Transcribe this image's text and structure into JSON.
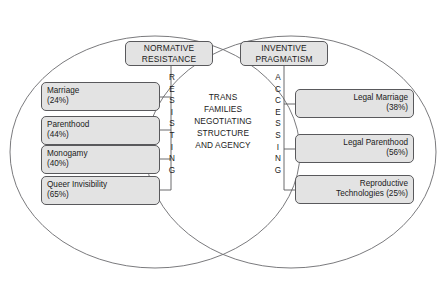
{
  "diagram": {
    "title_center": {
      "lines": [
        "TRANS",
        "FAMILIES",
        "NEGOTIATING",
        "STRUCTURE",
        "AND AGENCY"
      ]
    },
    "left_cluster": {
      "header_line1": "NORMATIVE",
      "header_line2": "RESISTANCE",
      "vertical_label": "RESISTING",
      "vertical_letters": [
        "R",
        "E",
        "S",
        "I",
        "S",
        "T",
        "I",
        "N",
        "G"
      ],
      "items": [
        {
          "label": "Marriage",
          "value": "(24%)"
        },
        {
          "label": "Parenthood",
          "value": "(44%)"
        },
        {
          "label": "Monogamy",
          "value": "(40%)"
        },
        {
          "label": "Queer Invisibility",
          "value": "(65%)"
        }
      ]
    },
    "right_cluster": {
      "header_line1": "INVENTIVE",
      "header_line2": "PRAGMATISM",
      "vertical_label": "ACCESSING",
      "vertical_letters": [
        "A",
        "C",
        "C",
        "E",
        "S",
        "S",
        "I",
        "N",
        "G"
      ],
      "items": [
        {
          "label": "Legal Marriage",
          "value": "(38%)"
        },
        {
          "label": "Legal Parenthood",
          "value": "(56%)"
        },
        {
          "label": "Reproductive",
          "value": "Technologies (25%)"
        }
      ]
    },
    "colors": {
      "box_fill": "#e3e3e3",
      "box_stroke": "#59595c",
      "ellipse_stroke": "#6b6b6e",
      "text": "#1a1a1a"
    }
  }
}
